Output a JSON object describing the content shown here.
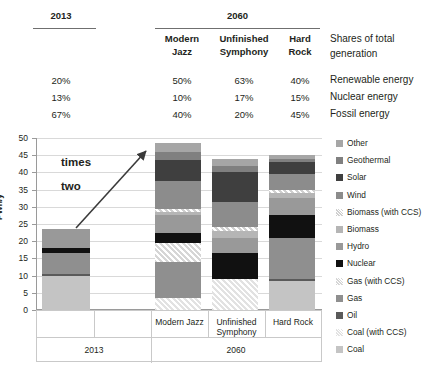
{
  "header": {
    "col_2013": "2013",
    "col_2060": "2060",
    "scenarios": [
      {
        "line1": "Modern",
        "line2": "Jazz"
      },
      {
        "line1": "Unfinished",
        "line2": "Symphony"
      },
      {
        "line1": "Hard",
        "line2": "Rock"
      }
    ],
    "caption": {
      "line1": "Shares of total",
      "line2": "generation"
    },
    "rows": [
      {
        "label": "Renewable energy",
        "y2013": "20%",
        "modern_jazz": "50%",
        "unfinished_symphony": "63%",
        "hard_rock": "40%"
      },
      {
        "label": "Nuclear energy",
        "y2013": "13%",
        "modern_jazz": "10%",
        "unfinished_symphony": "17%",
        "hard_rock": "15%"
      },
      {
        "label": "Fossil energy",
        "y2013": "67%",
        "modern_jazz": "40%",
        "unfinished_symphony": "20%",
        "hard_rock": "45%"
      }
    ]
  },
  "annotation": {
    "line1": "times",
    "line2": "two"
  },
  "xaxis": {
    "scenario_labels": [
      "",
      "",
      "Modern Jazz",
      "Unfinished Symphony",
      "Hard Rock"
    ],
    "group_2013": "2013",
    "group_2060": "2060"
  },
  "legend": {
    "items": [
      {
        "label": "Other",
        "color": "#a6a6a6",
        "pattern": "solid"
      },
      {
        "label": "Geothermal",
        "color": "#808080",
        "pattern": "solid"
      },
      {
        "label": "Solar",
        "color": "#3f3f3f",
        "pattern": "solid"
      },
      {
        "label": "Wind",
        "color": "#8c8c8c",
        "pattern": "solid"
      },
      {
        "label": "Biomass (with CCS)",
        "color": "#cfcfcf",
        "pattern": "hatch"
      },
      {
        "label": "Biomass",
        "color": "#b5b5b5",
        "pattern": "solid"
      },
      {
        "label": "Hydro",
        "color": "#999999",
        "pattern": "solid"
      },
      {
        "label": "Nuclear",
        "color": "#111111",
        "pattern": "solid"
      },
      {
        "label": "Gas (with CCS)",
        "color": "#d6d6d6",
        "pattern": "hatch"
      },
      {
        "label": "Gas",
        "color": "#8f8f8f",
        "pattern": "solid"
      },
      {
        "label": "Oil",
        "color": "#5a5a5a",
        "pattern": "solid"
      },
      {
        "label": "Coal (with CCS)",
        "color": "#e2e2e2",
        "pattern": "hatch"
      },
      {
        "label": "Coal",
        "color": "#c4c4c4",
        "pattern": "solid"
      }
    ]
  },
  "chart_data": {
    "type": "bar",
    "title": "",
    "xlabel": "",
    "ylabel": "PWh/y",
    "ylim": [
      0,
      50
    ],
    "yticks": [
      0,
      5,
      10,
      15,
      20,
      25,
      30,
      35,
      40,
      45,
      50
    ],
    "grid": true,
    "stacked": true,
    "legend_position": "right",
    "categories": [
      "2013",
      "Modern Jazz",
      "Unfinished Symphony",
      "Hard Rock"
    ],
    "totals": [
      23.5,
      48.5,
      44.0,
      45.0
    ],
    "series": [
      {
        "name": "Coal",
        "values": [
          10.0,
          0.0,
          0.0,
          8.5
        ]
      },
      {
        "name": "Coal (with CCS)",
        "values": [
          0.0,
          3.5,
          9.0,
          0.0
        ]
      },
      {
        "name": "Oil",
        "values": [
          0.6,
          0.0,
          0.0,
          0.4
        ]
      },
      {
        "name": "Gas",
        "values": [
          5.9,
          10.5,
          0.0,
          12.1
        ]
      },
      {
        "name": "Gas (with CCS)",
        "values": [
          0.0,
          5.5,
          0.0,
          0.0
        ]
      },
      {
        "name": "Nuclear",
        "values": [
          1.5,
          3.0,
          7.5,
          6.5
        ]
      },
      {
        "name": "Hydro",
        "values": [
          5.5,
          5.0,
          4.5,
          5.0
        ]
      },
      {
        "name": "Biomass",
        "values": [
          0.0,
          1.0,
          2.0,
          1.5
        ]
      },
      {
        "name": "Biomass (with CCS)",
        "values": [
          0.0,
          0.8,
          1.0,
          1.0
        ]
      },
      {
        "name": "Wind",
        "values": [
          0.0,
          8.2,
          7.5,
          4.5
        ]
      },
      {
        "name": "Solar",
        "values": [
          0.0,
          6.0,
          8.5,
          3.5
        ]
      },
      {
        "name": "Geothermal",
        "values": [
          0.0,
          2.5,
          2.0,
          1.0
        ]
      },
      {
        "name": "Other",
        "values": [
          0.0,
          2.5,
          2.0,
          1.0
        ]
      }
    ]
  }
}
